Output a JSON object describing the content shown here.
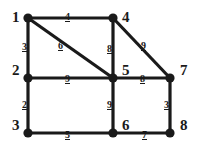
{
  "figure": {
    "width": 199,
    "height": 151,
    "background_color": "#ffffff",
    "edge_color": "#1a1a1a",
    "node_color": "#1a1a1a",
    "label_color": "#1a1a1a"
  },
  "chart_data": {
    "type": "diagram",
    "subtype": "weighted-undirected-graph",
    "node_count": 8,
    "edge_count": 12,
    "nodes": [
      {
        "id": "1",
        "label": "1",
        "x": 28,
        "y": 18,
        "label_x": 12,
        "label_y": 10
      },
      {
        "id": "4",
        "label": "4",
        "x": 113,
        "y": 18,
        "label_x": 122,
        "label_y": 10
      },
      {
        "id": "2",
        "label": "2",
        "x": 28,
        "y": 78,
        "label_x": 12,
        "label_y": 63
      },
      {
        "id": "5",
        "label": "5",
        "x": 113,
        "y": 78,
        "label_x": 122,
        "label_y": 63
      },
      {
        "id": "7",
        "label": "7",
        "x": 170,
        "y": 78,
        "label_x": 180,
        "label_y": 63
      },
      {
        "id": "3",
        "label": "3",
        "x": 28,
        "y": 133,
        "label_x": 12,
        "label_y": 118
      },
      {
        "id": "6",
        "label": "6",
        "x": 113,
        "y": 133,
        "label_x": 122,
        "label_y": 118
      },
      {
        "id": "8",
        "label": "8",
        "x": 170,
        "y": 133,
        "label_x": 180,
        "label_y": 118
      }
    ],
    "edges": [
      {
        "source": "1",
        "target": "4",
        "weight": "4",
        "label_x": 65,
        "label_y": 12
      },
      {
        "source": "1",
        "target": "2",
        "weight": "3",
        "label_x": 22,
        "label_y": 42
      },
      {
        "source": "1",
        "target": "5",
        "weight": "6",
        "label_x": 58,
        "label_y": 41
      },
      {
        "source": "4",
        "target": "5",
        "weight": "8",
        "label_x": 107,
        "label_y": 44
      },
      {
        "source": "4",
        "target": "7",
        "weight": "9",
        "label_x": 141,
        "label_y": 41
      },
      {
        "source": "2",
        "target": "5",
        "weight": "9",
        "label_x": 65,
        "label_y": 74
      },
      {
        "source": "2",
        "target": "3",
        "weight": "2",
        "label_x": 22,
        "label_y": 100
      },
      {
        "source": "5",
        "target": "7",
        "weight": "8",
        "label_x": 140,
        "label_y": 74
      },
      {
        "source": "5",
        "target": "6",
        "weight": "9",
        "label_x": 107,
        "label_y": 100
      },
      {
        "source": "7",
        "target": "8",
        "weight": "3",
        "label_x": 164,
        "label_y": 100
      },
      {
        "source": "3",
        "target": "6",
        "weight": "5",
        "label_x": 65,
        "label_y": 130
      },
      {
        "source": "6",
        "target": "8",
        "weight": "7",
        "label_x": 142,
        "label_y": 130
      }
    ]
  }
}
